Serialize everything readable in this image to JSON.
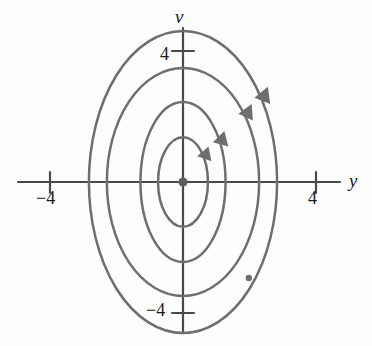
{
  "chart_data": {
    "type": "line",
    "title": "",
    "subtitle": "",
    "xlabel": "y",
    "ylabel": "v",
    "xlim": [
      -5.5,
      5.7
    ],
    "ylim": [
      -5.0,
      4.8
    ],
    "grid": false,
    "legend": null,
    "axes": {
      "x_axis": {
        "label": "y",
        "tick_values": [
          -4,
          4
        ],
        "tick_labels": [
          "−4",
          "4"
        ],
        "pixel_origin": 183,
        "pixels_per_unit": 33.25
      },
      "y_axis": {
        "label": "v",
        "tick_values": [
          4,
          -4
        ],
        "tick_labels": [
          "4",
          "−4"
        ],
        "pixel_origin": 182,
        "pixels_per_unit": 32.75
      }
    },
    "equilibrium_point": {
      "y": 0,
      "v": 0,
      "type": "center",
      "marker": "filled-circle"
    },
    "orbits": [
      {
        "name": "orbit-1",
        "semi_axis_y": 0.75,
        "semi_axis_v": 1.37,
        "direction": "clockwise"
      },
      {
        "name": "orbit-2",
        "semi_axis_y": 1.28,
        "semi_axis_v": 2.44,
        "direction": "clockwise"
      },
      {
        "name": "orbit-3",
        "semi_axis_y": 2.29,
        "semi_axis_v": 3.48,
        "direction": "clockwise"
      },
      {
        "name": "orbit-4",
        "semi_axis_y": 2.83,
        "semi_axis_v": 4.61,
        "direction": "clockwise"
      }
    ],
    "direction_arrows": [
      {
        "orbit": "orbit-1",
        "y": 0.66,
        "v": 0.73,
        "direction": "clockwise"
      },
      {
        "orbit": "orbit-2",
        "y": 1.2,
        "v": 1.22,
        "direction": "clockwise"
      },
      {
        "orbit": "orbit-3",
        "y": 1.71,
        "v": 1.8,
        "direction": "clockwise"
      },
      {
        "orbit": "orbit-4",
        "y": 2.26,
        "v": 2.35,
        "direction": "clockwise"
      }
    ],
    "point_markers": [
      {
        "orbit": "orbit-4",
        "y": 1.98,
        "v": -2.93,
        "marker": "filled-circle"
      }
    ],
    "colors": {
      "orbit_stroke": "#6e6e6e",
      "axis_stroke": "#4a4a4a",
      "text": "#1a1a1a",
      "background": "#fdfdfd"
    }
  },
  "labels": {
    "v_axis": "v",
    "y_axis": "y",
    "tick_v_positive": "4",
    "tick_v_negative": "−4",
    "tick_y_positive": "4",
    "tick_y_negative": "−4"
  }
}
